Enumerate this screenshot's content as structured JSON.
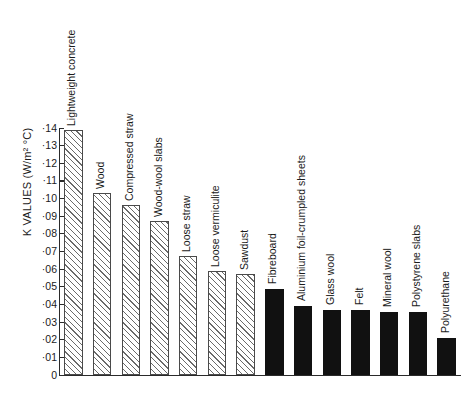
{
  "chart_data": {
    "type": "bar",
    "title": "",
    "xlabel": "",
    "ylabel": "K VALUES (W/m² °C)",
    "ylim": [
      0,
      1.4
    ],
    "grid": false,
    "legend": "none",
    "y_tick_labels": [
      "·14",
      "·13",
      "·12",
      "·11",
      "·10",
      "·09",
      "·08",
      "·07",
      "·06",
      "·05",
      "·04",
      "·03",
      "·02",
      "·01",
      "0"
    ],
    "y_tick_values": [
      1.4,
      1.3,
      1.2,
      1.1,
      1.0,
      0.9,
      0.8,
      0.7,
      0.6,
      0.5,
      0.4,
      0.3,
      0.2,
      0.1,
      0
    ],
    "categories": [
      "Lightweight concrete",
      "Wood",
      "Compressed straw",
      "Wood-wool slabs",
      "Loose straw",
      "Loose vermiculite",
      "Sawdust",
      "Fibreboard",
      "Aluminium foil-crumpled sheets",
      "Glass wool",
      "Felt",
      "Mineral wool",
      "Polystyrene slabs",
      "Polyurethane"
    ],
    "values": [
      1.39,
      1.03,
      0.965,
      0.875,
      0.675,
      0.59,
      0.575,
      0.485,
      0.39,
      0.37,
      0.37,
      0.355,
      0.355,
      0.21
    ],
    "fills": [
      "hatched",
      "hatched",
      "hatched",
      "hatched",
      "hatched",
      "hatched",
      "hatched",
      "solid",
      "solid",
      "solid",
      "solid",
      "solid",
      "solid",
      "solid"
    ],
    "colors": {
      "hatched_outline": "#4a4a4a",
      "hatched_fill": "#ffffff",
      "solid_fill": "#111111",
      "axis": "#2a2a2a",
      "text": "#1b1b1b",
      "background": "#ffffff"
    }
  }
}
